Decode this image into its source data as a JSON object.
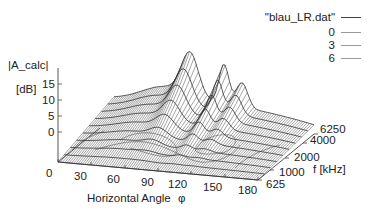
{
  "chart_data": {
    "type": "surface3d",
    "title": "",
    "xlabel": "Horizontal Angle φ",
    "ylabel": "f [kHz]",
    "zlabel": "|A_calc|",
    "zunit": "[dB]",
    "x_ticks": [
      "0",
      "30",
      "60",
      "90",
      "120",
      "150",
      "180"
    ],
    "y_ticks": [
      "625",
      "1000",
      "2000",
      "4000",
      "6250"
    ],
    "z_ticks": [
      "0",
      "5",
      "10",
      "15"
    ],
    "xlim": [
      0,
      180
    ],
    "ylim": [
      625,
      6250
    ],
    "zlim": [
      0,
      15
    ],
    "legend": {
      "position": "top-right",
      "entries": [
        {
          "label": "\"blau_LR.dat\"",
          "style": "surface"
        },
        {
          "label": "0",
          "style": "contour"
        },
        {
          "label": "3",
          "style": "contour"
        },
        {
          "label": "6",
          "style": "contour"
        }
      ]
    },
    "contour_levels": [
      0,
      3,
      6
    ],
    "series": [
      {
        "name": "blau_LR.dat",
        "description": "Surface peaking near φ≈75° and φ≈100° at high frequency (~6250 kHz), rising above 15 dB"
      }
    ],
    "grid": false
  },
  "axes": {
    "z_label": "|A_calc|",
    "z_unit": "[dB]",
    "x_label": "Horizontal Angle",
    "x_symbol": "φ",
    "y_label": "f [kHz]"
  },
  "legend": {
    "title": "\"blau_LR.dat\"",
    "items": [
      "0",
      "3",
      "6"
    ]
  }
}
